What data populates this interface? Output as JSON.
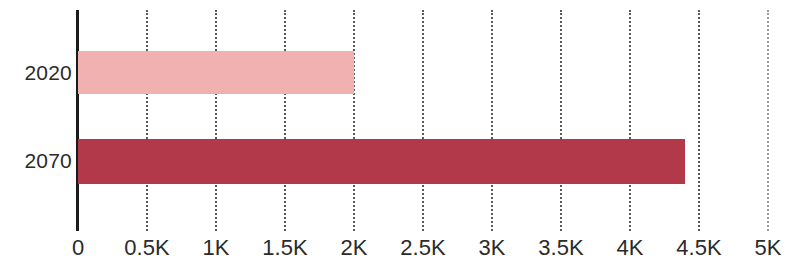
{
  "chart_data": {
    "type": "bar",
    "orientation": "horizontal",
    "title": "",
    "subtitle": "",
    "xlabel": "",
    "ylabel": "",
    "categories": [
      "2020",
      "2070"
    ],
    "values": [
      2000,
      4400
    ],
    "series": [
      {
        "name": "",
        "values": [
          2000,
          4400
        ],
        "colors": [
          "#f2b1b1",
          "#b2394a"
        ]
      }
    ],
    "bar_colors": {
      "2020": "#f2b1b1",
      "2070": "#b2394a"
    },
    "xlim": [
      0,
      5000
    ],
    "ylim": null,
    "grid": true,
    "grid_axis": "x",
    "grid_style": "dotted",
    "grid_color": "#5a5a5a",
    "legend": false,
    "legend_position": "none",
    "axis_line_color": "#1b1b1b",
    "tick_label_color": "#2b2b2b",
    "background_color": "#ffffff",
    "x_ticks": [
      {
        "value": 0,
        "label": "0"
      },
      {
        "value": 500,
        "label": "0.5K"
      },
      {
        "value": 1000,
        "label": "1K"
      },
      {
        "value": 1500,
        "label": "1.5K"
      },
      {
        "value": 2000,
        "label": "2K"
      },
      {
        "value": 2500,
        "label": "2.5K"
      },
      {
        "value": 3000,
        "label": "3K"
      },
      {
        "value": 3500,
        "label": "3.5K"
      },
      {
        "value": 4000,
        "label": "4K"
      },
      {
        "value": 4500,
        "label": "4.5K"
      },
      {
        "value": 5000,
        "label": "5K"
      }
    ],
    "y_ticks": [
      {
        "label": "2020"
      },
      {
        "label": "2070"
      }
    ],
    "annotations": []
  }
}
